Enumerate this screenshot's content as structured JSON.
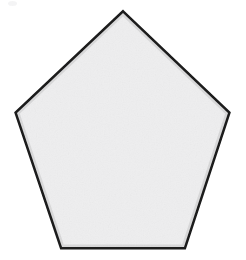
{
  "canvas": {
    "width": 246,
    "height": 260,
    "background_color": "#ffffff"
  },
  "figure": {
    "name": "pentagon",
    "shape_type": "regular-pentagon",
    "sides": 5,
    "orientation": "apex-up",
    "fill_color": "#f0f0f0",
    "fill_texture": "subtle-noise",
    "stroke_color": "#1a1a1a",
    "stroke_width": 5,
    "stroke_linejoin": "miter",
    "center": {
      "x": 123,
      "y": 140
    },
    "circumradius": 128,
    "vertices": [
      {
        "label": "apex",
        "x": 123,
        "y": 13
      },
      {
        "x": 228,
        "y": 113,
        "label": "right"
      },
      {
        "label": "bottom-right",
        "x": 184,
        "y": 247
      },
      {
        "label": "bottom-left",
        "x": 62,
        "y": 247
      },
      {
        "label": "left",
        "x": 17,
        "y": 113
      }
    ],
    "points_string": "123,13 228,113 184,247 62,247 17,113"
  },
  "artifacts": [
    {
      "name": "corner-smudge",
      "color": "#f2f2f3",
      "x": 8,
      "y": 1,
      "width": 9,
      "height": 5
    }
  ]
}
